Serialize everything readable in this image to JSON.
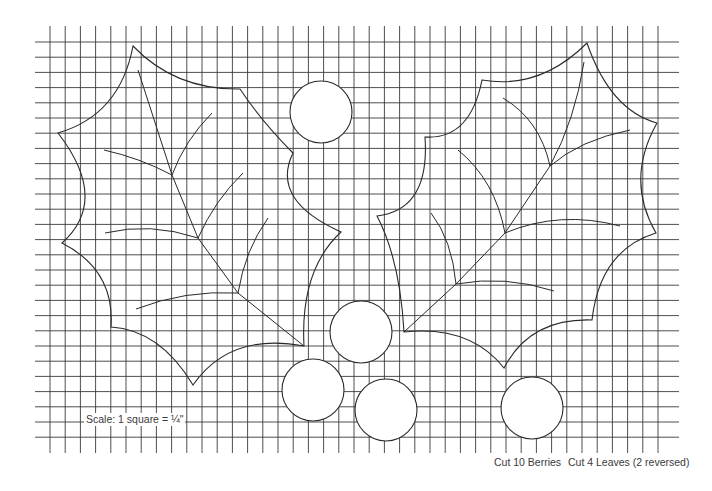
{
  "pattern": {
    "title": "Holly leaves and berries quilting pattern",
    "grid": {
      "x_start": 35,
      "x_end": 679,
      "y_start": 42,
      "y_end": 437,
      "v_line_top": 26,
      "v_line_bottom": 453,
      "first_v_line_x": 50,
      "spacing": 15.2,
      "v_line_count": 41,
      "h_line_count": 27
    },
    "leaves": [
      {
        "name": "left-leaf",
        "outline_points": [
          [
            133,
            46
          ],
          [
            240,
            89
          ],
          [
            293,
            153
          ],
          [
            341,
            232
          ],
          [
            304,
            346
          ],
          [
            193,
            385
          ],
          [
            111,
            327
          ],
          [
            62,
            243
          ],
          [
            58,
            133
          ]
        ],
        "midrib": [
          [
            138,
            70
          ],
          [
            172,
            175
          ],
          [
            198,
            238
          ],
          [
            238,
            293
          ],
          [
            304,
            346
          ]
        ]
      },
      {
        "name": "right-leaf",
        "outline_points": [
          [
            587,
            43
          ],
          [
            657,
            123
          ],
          [
            656,
            233
          ],
          [
            592,
            320
          ],
          [
            504,
            368
          ],
          [
            404,
            332
          ],
          [
            377,
            216
          ],
          [
            425,
            137
          ],
          [
            482,
            80
          ]
        ],
        "midrib": [
          [
            584,
            62
          ],
          [
            550,
            166
          ],
          [
            505,
            233
          ],
          [
            456,
            284
          ],
          [
            404,
            332
          ]
        ]
      }
    ],
    "berries": [
      {
        "cx": 321,
        "cy": 112,
        "r": 31
      },
      {
        "cx": 361,
        "cy": 332,
        "r": 31
      },
      {
        "cx": 313,
        "cy": 390,
        "r": 31
      },
      {
        "cx": 386,
        "cy": 410,
        "r": 31
      },
      {
        "cx": 532,
        "cy": 408,
        "r": 31
      }
    ],
    "line_color": "#2a2a2a",
    "grid_color": "#3a3a3a"
  },
  "labels": {
    "scale": "Scale: 1 square = ¼\"",
    "cut_berries": "Cut 10 Berries",
    "cut_leaves": "Cut 4 Leaves (2 reversed)"
  }
}
